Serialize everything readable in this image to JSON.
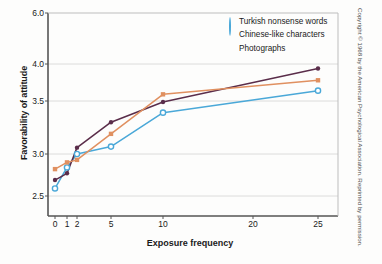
{
  "chart_data": {
    "type": "line",
    "title": "",
    "xlabel": "Exposure frequency",
    "ylabel": "Favorability of attitude",
    "x": [
      0,
      1,
      2,
      5,
      10,
      25
    ],
    "xticklabels": [
      "0",
      "1",
      "2",
      "5",
      "10",
      "20",
      "25"
    ],
    "xtickvalues": [
      0,
      1,
      2,
      5,
      10,
      20,
      25
    ],
    "yticklabels": [
      "6.0",
      "4.0",
      "3.5",
      "3.0",
      "2.5"
    ],
    "ytickvalues": [
      6.0,
      4.0,
      3.5,
      3.0,
      2.5
    ],
    "ylim": [
      2.5,
      6.0
    ],
    "grid": "horizontal",
    "legend_position": "top-right",
    "series": [
      {
        "name": "Turkish nonsense words",
        "color": "#4aa8d8",
        "marker": "open-circle",
        "values": [
          2.59,
          2.84,
          3.0,
          3.07,
          3.39,
          3.64
        ]
      },
      {
        "name": "Chinese-like characters",
        "color": "#5a2d4a",
        "marker": "filled-circle",
        "values": [
          2.69,
          2.77,
          3.06,
          3.3,
          3.49,
          3.94
        ]
      },
      {
        "name": "Photographs",
        "color": "#e09060",
        "marker": "filled-square",
        "values": [
          2.82,
          2.9,
          2.93,
          3.19,
          3.59,
          3.78
        ]
      }
    ]
  },
  "legend": {
    "items": [
      {
        "label": "Turkish nonsense words"
      },
      {
        "label": "Chinese-like characters"
      },
      {
        "label": "Photographs"
      }
    ]
  },
  "axes": {
    "x_title": "Exposure frequency",
    "y_title": "Favorability of attitude"
  },
  "credit": {
    "text": "Copyright © 1968 by the American Psychological Association. Reprinted by permission."
  }
}
